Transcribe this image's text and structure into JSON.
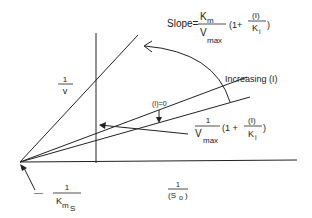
{
  "diagram": {
    "y_axis_label": {
      "num": "1",
      "den": "v"
    },
    "x_axis_label": {
      "num": "1",
      "den": "(S",
      "den_sub": "o",
      "den_close": ")"
    },
    "x_intercept_label": {
      "prefix": "—",
      "num": "1",
      "den": "K",
      "den_sub": "m",
      "den_sub2": "S"
    },
    "slope_label": {
      "prefix": "Slope=",
      "num": "K",
      "num_sub": "m",
      "den": "V",
      "den_sub": "max",
      "factor_open": "(1+",
      "frac_num": "(I)",
      "frac_den": "K",
      "frac_den_sub": "i",
      "factor_close": ")"
    },
    "intercept_label": {
      "num": "1",
      "den": "V",
      "den_sub": "max",
      "factor_open": "(1 +",
      "frac_num": "(I)",
      "frac_den": "K",
      "frac_den_sub": "i",
      "factor_close": ")"
    },
    "zero_inhibitor_label": "(I)=0",
    "increasing_label": "Increasing (I)",
    "line_color": "#222222"
  }
}
